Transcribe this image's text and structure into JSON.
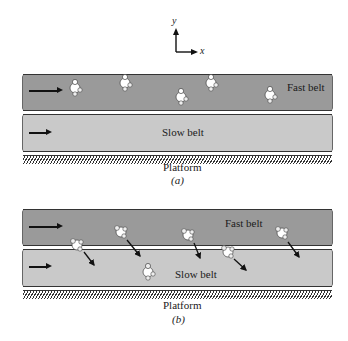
{
  "axes": {
    "y_label": "y",
    "x_label": "x"
  },
  "panel_a": {
    "fast_belt_label": "Fast belt",
    "slow_belt_label": "Slow belt",
    "platform_label": "Platform",
    "caption": "(a)",
    "fast_belt_people_count": "5",
    "description": "People standing on the fast belt"
  },
  "panel_b": {
    "fast_belt_label": "Fast belt",
    "slow_belt_label": "Slow belt",
    "platform_label": "Platform",
    "caption": "(b)",
    "description": "People stepping from the fast belt onto the slow belt, velocity arrows pointing down-right"
  },
  "colors": {
    "fast_belt": "#9a9a9a",
    "slow_belt": "#c9c9c9",
    "outline": "#333333",
    "arrow": "#111111"
  }
}
